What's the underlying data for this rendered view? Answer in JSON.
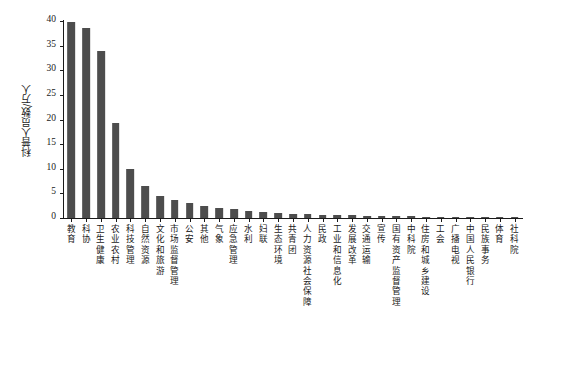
{
  "chart_data": {
    "type": "bar",
    "title": "",
    "xlabel": "",
    "ylabel": "科普人员数/万人",
    "ylim": [
      0,
      40
    ],
    "yticks": [
      0,
      5,
      10,
      15,
      20,
      25,
      30,
      35,
      40
    ],
    "grid": false,
    "legend": null,
    "bar_color": "#4d4d4d",
    "axis_color": "#1a1a1a",
    "categories": [
      "教育",
      "科协",
      "卫生健康",
      "农业农村",
      "科技管理",
      "自然资源",
      "文化和旅游",
      "市场监督管理",
      "公安",
      "其他",
      "气象",
      "应急管理",
      "水利",
      "妇联",
      "生态环境",
      "共青团",
      "人力资源社会保障",
      "民政",
      "工业和信息化",
      "发展改革",
      "交通运输",
      "宣传",
      "国有资产监督管理",
      "中科院",
      "住房和城乡建设",
      "工会",
      "广播电视",
      "中国人民银行",
      "民族事务",
      "体育",
      "社科院"
    ],
    "values": [
      39.8,
      38.6,
      34.0,
      19.3,
      10.0,
      6.6,
      4.4,
      3.6,
      3.1,
      2.5,
      2.1,
      1.9,
      1.5,
      1.2,
      1.0,
      0.85,
      0.8,
      0.7,
      0.6,
      0.55,
      0.5,
      0.45,
      0.4,
      0.35,
      0.3,
      0.28,
      0.25,
      0.22,
      0.18,
      0.15,
      0.1
    ]
  }
}
